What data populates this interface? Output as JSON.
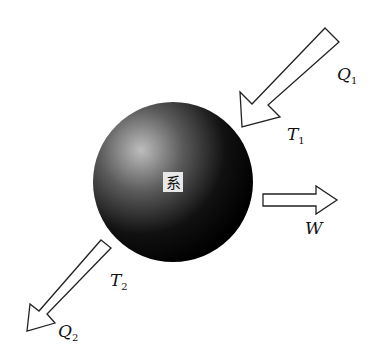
{
  "diagram": {
    "system_label": "系",
    "inputs": [
      {
        "id": "heat-in",
        "label": "Q",
        "subscript": "1",
        "temp_label": "T",
        "temp_subscript": "1"
      }
    ],
    "outputs": [
      {
        "id": "heat-out",
        "label": "Q",
        "subscript": "2",
        "temp_label": "T",
        "temp_subscript": "2"
      },
      {
        "id": "work-out",
        "label": "W"
      }
    ]
  }
}
